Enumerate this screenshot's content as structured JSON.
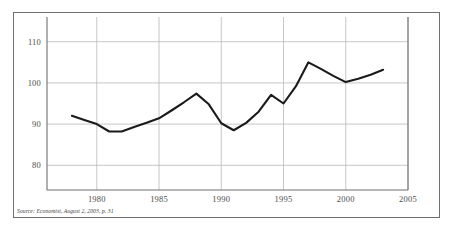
{
  "chart_data": {
    "type": "line",
    "title": "",
    "subtitle": "",
    "xlabel": "",
    "ylabel": "",
    "xlim": [
      1976.0,
      2005.0
    ],
    "ylim": [
      74.0,
      116.0
    ],
    "xticks": [
      "1980",
      "1985",
      "1990",
      "1995",
      "2000",
      "2005"
    ],
    "xtick_values": [
      1980,
      1985,
      1990,
      1995,
      2000,
      2005
    ],
    "yticks": [
      "80",
      "90",
      "100",
      "110"
    ],
    "ytick_values": [
      80,
      90,
      100,
      110
    ],
    "grid": "both",
    "legend": "none",
    "annotations": [],
    "series": [
      {
        "name": "index",
        "color": "#1a1a1a",
        "x": [
          1978,
          1979,
          1980,
          1981,
          1982,
          1983,
          1984,
          1985,
          1986,
          1987,
          1988,
          1989,
          1990,
          1991,
          1992,
          1993,
          1994,
          1995,
          1996,
          1997,
          1998,
          1999,
          2000,
          2001,
          2002,
          2003
        ],
        "values": [
          92.0,
          91.0,
          90.0,
          88.2,
          88.2,
          89.3,
          90.3,
          91.4,
          93.3,
          95.3,
          97.4,
          94.8,
          90.2,
          88.5,
          90.3,
          93.0,
          97.1,
          95.0,
          99.2,
          105.0,
          103.4,
          101.7,
          100.2,
          101.0,
          102.0,
          103.2
        ]
      }
    ]
  },
  "axis": {
    "y_tick_labels": [
      "110",
      "100",
      "90",
      "80"
    ],
    "x_tick_labels": [
      "1980",
      "1985",
      "1990",
      "1995",
      "2000",
      "2005"
    ]
  },
  "footer": {
    "source": "Source: Economist, August 2, 2003, p. 31"
  },
  "colors": {
    "line": "#1a1a1a",
    "grid": "#b9b9b9",
    "spine": "#6f6f6f",
    "frame": "#6f6f6f",
    "tick_text": "#4c4c4c",
    "background": "#ffffff"
  }
}
